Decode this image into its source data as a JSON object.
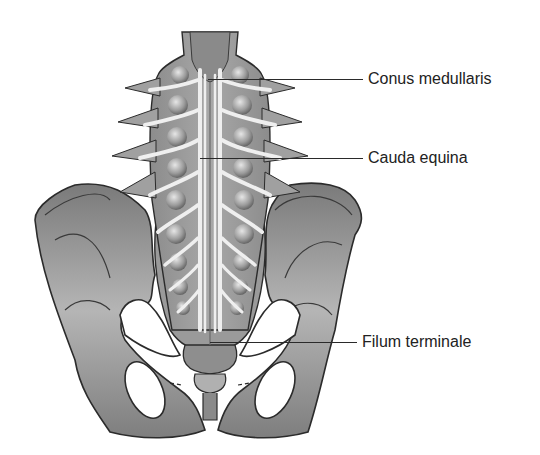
{
  "figure": {
    "colors": {
      "bone_dark": "#6e6e6e",
      "bone_mid": "#9a9a9a",
      "bone_light": "#c8c8c8",
      "nerve": "#eeeeee",
      "outline": "#2b2b2b",
      "label_text": "#222222"
    }
  },
  "labels": [
    {
      "id": "conus",
      "text": "Conus medullaris"
    },
    {
      "id": "cauda",
      "text": "Cauda equina"
    },
    {
      "id": "filum",
      "text": "Filum terminale"
    }
  ]
}
